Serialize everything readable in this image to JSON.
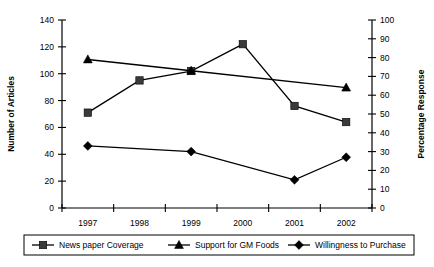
{
  "chart_data": {
    "type": "line",
    "title": "",
    "xlabel": "",
    "ylabel": "Number of Articles",
    "y2label": "Percentage Response",
    "categories": [
      "1997",
      "1998",
      "1999",
      "2000",
      "2001",
      "2002"
    ],
    "ylim": [
      0,
      140
    ],
    "y2lim": [
      0,
      100
    ],
    "yticks": [
      "0",
      "20",
      "40",
      "60",
      "80",
      "100",
      "120",
      "140"
    ],
    "y2ticks": [
      "0",
      "10",
      "20",
      "30",
      "40",
      "50",
      "60",
      "70",
      "80",
      "90",
      "100"
    ],
    "grid": false,
    "legend_position": "bottom",
    "series": [
      {
        "name": "News paper Coverage",
        "marker": "square",
        "axis": "left",
        "x": [
          "1997",
          "1998",
          "1999",
          "2000",
          "2001",
          "2002"
        ],
        "values": [
          71,
          95,
          102,
          122,
          76,
          64
        ]
      },
      {
        "name": "Support for GM Foods",
        "marker": "triangle",
        "axis": "right",
        "x": [
          "1997",
          "1999",
          "2002"
        ],
        "values": [
          79,
          73,
          64
        ]
      },
      {
        "name": "Willingness to Purchase",
        "marker": "diamond",
        "axis": "right",
        "x": [
          "1997",
          "1999",
          "2001",
          "2002"
        ],
        "values": [
          33,
          30,
          15,
          27
        ]
      }
    ]
  },
  "legend": {
    "items": [
      {
        "label": "News paper Coverage",
        "marker": "square"
      },
      {
        "label": "Support for GM Foods",
        "marker": "triangle"
      },
      {
        "label": "Willingness to Purchase",
        "marker": "diamond"
      }
    ]
  },
  "colors": {
    "axis": "#000000",
    "series_square": "#3a3a3a",
    "series_triangle": "#000000",
    "series_diamond": "#000000",
    "background": "#ffffff"
  }
}
